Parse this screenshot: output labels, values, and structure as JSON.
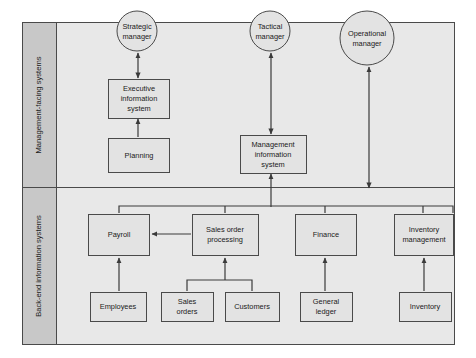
{
  "diagram": {
    "colors": {
      "page_background": "#ffffff",
      "frame_fill": "#e8e8e8",
      "band_label_fill": "#c8c8c8",
      "node_fill": "#e3e3e3",
      "stroke": "#4a4a4a",
      "text": "#1a1a1a"
    },
    "bands": [
      {
        "id": "management-facing",
        "label": "Management-facing systems"
      },
      {
        "id": "back-end",
        "label": "Back-end information systems"
      }
    ],
    "actors": [
      {
        "id": "strategic-manager",
        "shape": "circle",
        "lines": [
          "Strategic",
          "manager"
        ],
        "cx": 137,
        "cy": 31,
        "r": 20
      },
      {
        "id": "tactical-manager",
        "shape": "circle",
        "lines": [
          "Tactical",
          "manager"
        ],
        "cx": 270,
        "cy": 31,
        "r": 20
      },
      {
        "id": "operational-manager",
        "shape": "circle",
        "lines": [
          "Operational",
          "manager"
        ],
        "cx": 367,
        "cy": 38,
        "r": 27
      }
    ],
    "nodes": [
      {
        "id": "executive-information-system",
        "band": "management-facing",
        "lines": [
          "Executive",
          "information",
          "system"
        ],
        "x": 108,
        "y": 79,
        "w": 61,
        "h": 39
      },
      {
        "id": "planning",
        "band": "management-facing",
        "lines": [
          "Planning"
        ],
        "x": 108,
        "y": 138,
        "w": 61,
        "h": 34
      },
      {
        "id": "management-information-system",
        "band": "management-facing",
        "lines": [
          "Management",
          "information",
          "system"
        ],
        "x": 240,
        "y": 135,
        "w": 66,
        "h": 38
      },
      {
        "id": "payroll",
        "band": "back-end",
        "lines": [
          "Payroll"
        ],
        "x": 88,
        "y": 214,
        "w": 61,
        "h": 41
      },
      {
        "id": "sales-order-processing",
        "band": "back-end",
        "lines": [
          "Sales order",
          "processing"
        ],
        "x": 192,
        "y": 214,
        "w": 66,
        "h": 41
      },
      {
        "id": "finance",
        "band": "back-end",
        "lines": [
          "Finance"
        ],
        "x": 295,
        "y": 214,
        "w": 61,
        "h": 41
      },
      {
        "id": "inventory-management",
        "band": "back-end",
        "lines": [
          "Inventory",
          "management"
        ],
        "x": 394,
        "y": 214,
        "w": 59,
        "h": 41
      },
      {
        "id": "employees",
        "band": "back-end",
        "lines": [
          "Employees"
        ],
        "x": 90,
        "y": 292,
        "w": 56,
        "h": 29
      },
      {
        "id": "sales-orders",
        "band": "back-end",
        "lines": [
          "Sales",
          "orders"
        ],
        "x": 161,
        "y": 292,
        "w": 52,
        "h": 29
      },
      {
        "id": "customers",
        "band": "back-end",
        "lines": [
          "Customers"
        ],
        "x": 225,
        "y": 292,
        "w": 54,
        "h": 29
      },
      {
        "id": "general-ledger",
        "band": "back-end",
        "lines": [
          "General",
          "ledger"
        ],
        "x": 300,
        "y": 292,
        "w": 52,
        "h": 29
      },
      {
        "id": "inventory",
        "band": "back-end",
        "lines": [
          "Inventory"
        ],
        "x": 399,
        "y": 292,
        "w": 52,
        "h": 29
      }
    ],
    "connections": [
      {
        "from": "executive-information-system",
        "to": "strategic-manager",
        "type": "double-arrow"
      },
      {
        "from": "planning",
        "to": "executive-information-system",
        "type": "arrow"
      },
      {
        "from": "management-information-system",
        "to": "tactical-manager",
        "type": "double-arrow"
      },
      {
        "from": "back-end-bus",
        "to": "operational-manager",
        "type": "double-arrow"
      },
      {
        "from": "back-end-bus",
        "to": "management-information-system",
        "type": "arrow"
      },
      {
        "from": "sales-order-processing",
        "to": "payroll",
        "type": "arrow"
      },
      {
        "from": "employees",
        "to": "payroll",
        "type": "arrow"
      },
      {
        "from": "sales-orders",
        "to": "sales-order-processing",
        "type": "arrow"
      },
      {
        "from": "customers",
        "to": "sales-order-processing",
        "type": "arrow"
      },
      {
        "from": "general-ledger",
        "to": "finance",
        "type": "arrow"
      },
      {
        "from": "inventory",
        "to": "inventory-management",
        "type": "arrow"
      }
    ]
  }
}
